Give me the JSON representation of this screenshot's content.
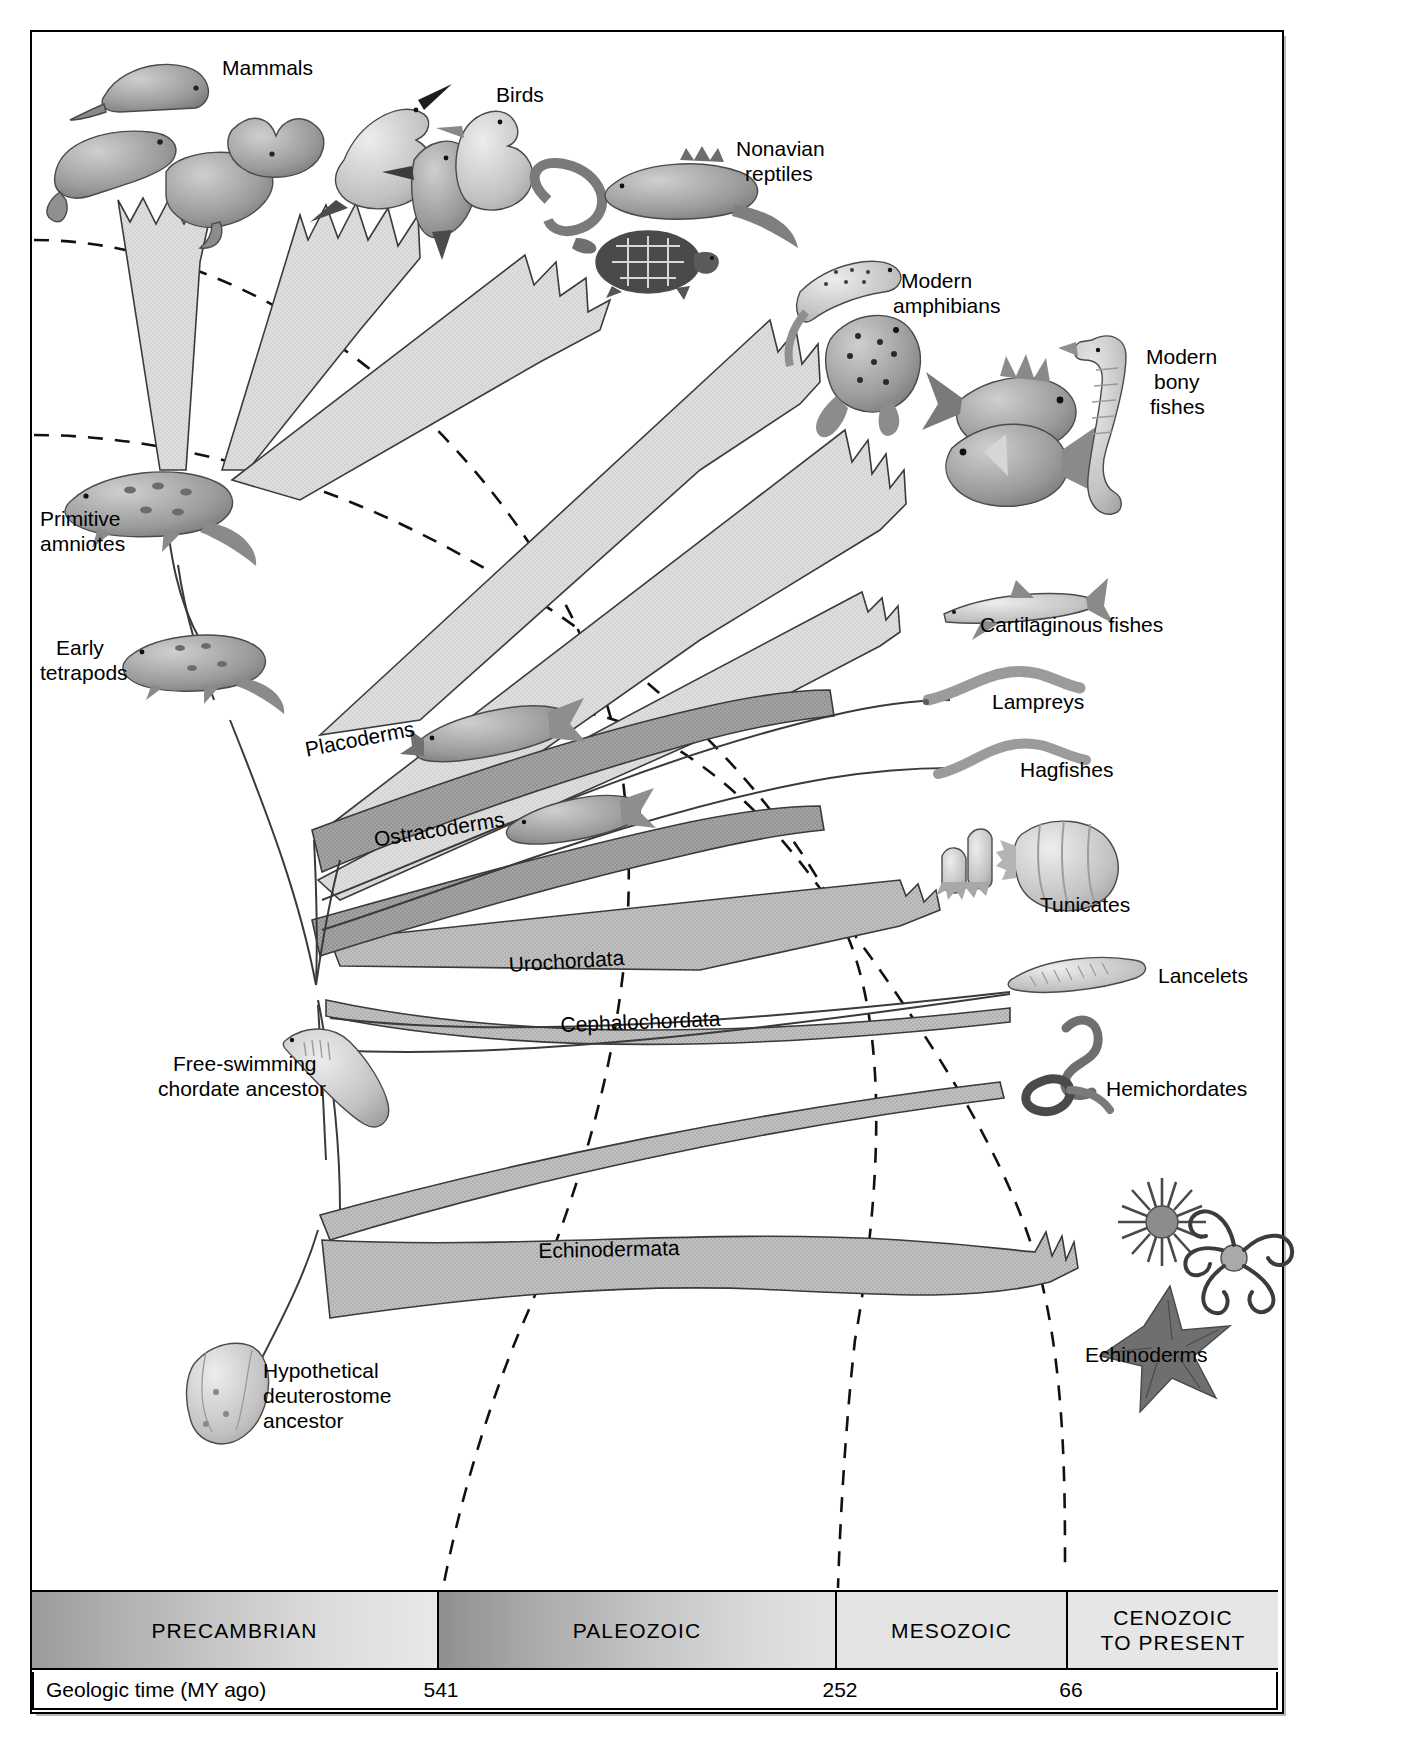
{
  "figure": {
    "kind": "phylogeny-of-deuterostomes",
    "background": "#ffffff"
  },
  "taxon_labels": [
    {
      "id": "mammals",
      "text": "Mammals"
    },
    {
      "id": "birds",
      "text": "Birds"
    },
    {
      "id": "nonavian-reptiles",
      "text": "Nonavian\nreptiles"
    },
    {
      "id": "modern-amphibians",
      "text": "Modern\namphibians"
    },
    {
      "id": "modern-bony-fishes",
      "text": "Modern\nbony\nfishes"
    },
    {
      "id": "cartilaginous-fishes",
      "text": "Cartilaginous fishes"
    },
    {
      "id": "lampreys",
      "text": "Lampreys"
    },
    {
      "id": "hagfishes",
      "text": "Hagfishes"
    },
    {
      "id": "tunicates",
      "text": "Tunicates"
    },
    {
      "id": "lancelets",
      "text": "Lancelets"
    },
    {
      "id": "hemichordates",
      "text": "Hemichordates"
    },
    {
      "id": "echinoderms",
      "text": "Echinoderms"
    },
    {
      "id": "primitive-amniotes",
      "text": "Primitive\namniotes"
    },
    {
      "id": "early-tetrapods",
      "text": "Early\ntetrapods"
    },
    {
      "id": "placoderms",
      "text": "Placoderms"
    },
    {
      "id": "ostracoderms",
      "text": "Ostracoderms"
    },
    {
      "id": "urochordata",
      "text": "Urochordata"
    },
    {
      "id": "cephalochordata",
      "text": "Cephalochordata"
    },
    {
      "id": "echinodermata",
      "text": "Echinodermata"
    },
    {
      "id": "free-swimming-chordate-ancestor",
      "text": "Free-swimming\nchordate ancestor"
    },
    {
      "id": "hypothetical-deuterostome-ancestor",
      "text": "Hypothetical\ndeuterostome\nancestor"
    }
  ],
  "labels": {
    "mammals": "Mammals",
    "birds": "Birds",
    "nonavian_reptiles_l1": "Nonavian",
    "nonavian_reptiles_l2": "reptiles",
    "modern_amphibians_l1": "Modern",
    "modern_amphibians_l2": "amphibians",
    "modern_bony_fishes_l1": "Modern",
    "modern_bony_fishes_l2": "bony",
    "modern_bony_fishes_l3": "fishes",
    "cartilaginous_fishes": "Cartilaginous fishes",
    "lampreys": "Lampreys",
    "hagfishes": "Hagfishes",
    "tunicates": "Tunicates",
    "lancelets": "Lancelets",
    "hemichordates": "Hemichordates",
    "echinoderms": "Echinoderms",
    "primitive_amniotes_l1": "Primitive",
    "primitive_amniotes_l2": "amniotes",
    "early_tetrapods_l1": "Early",
    "early_tetrapods_l2": "tetrapods",
    "placoderms": "Placoderms",
    "ostracoderms": "Ostracoderms",
    "urochordata": "Urochordata",
    "cephalochordata": "Cephalochordata",
    "echinodermata": "Echinodermata",
    "free_swimming_l1": "Free-swimming",
    "free_swimming_l2": "chordate ancestor",
    "hypothetical_l1": "Hypothetical",
    "hypothetical_l2": "deuterostome",
    "hypothetical_l3": "ancestor"
  },
  "timescale": {
    "row_label": "Geologic time (MY ago)",
    "eras": [
      {
        "name": "PRECAMBRIAN"
      },
      {
        "name": "PALEOZOIC"
      },
      {
        "name": "MESOZOIC"
      },
      {
        "name": "CENOZOIC\nTO PRESENT"
      }
    ],
    "era_cenozoic_l1": "CENOZOIC",
    "era_cenozoic_l2": "TO PRESENT",
    "boundaries": [
      {
        "value": "541",
        "x": 439
      },
      {
        "value": "252",
        "x": 838
      },
      {
        "value": "66",
        "x": 1069
      }
    ]
  },
  "colors": {
    "ink": "#000000",
    "band_light": "#d9d9d9",
    "band_mid": "#b4b4b4",
    "band_dark": "#8f8f8f",
    "frame_shadow": "#b9b9b9",
    "page": "#ffffff"
  }
}
